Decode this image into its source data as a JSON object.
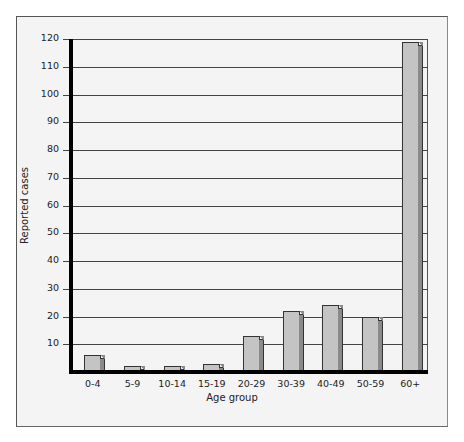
{
  "chart_data": {
    "type": "bar",
    "title": "",
    "xlabel": "Age group",
    "ylabel": "Reported cases",
    "categories": [
      "0-4",
      "5-9",
      "10-14",
      "15-19",
      "20-29",
      "30-39",
      "40-49",
      "50-59",
      "60+"
    ],
    "values": [
      6,
      2,
      2,
      3,
      13,
      22,
      24,
      20,
      119
    ],
    "ylim": [
      0,
      120
    ],
    "yticks": [
      10,
      20,
      30,
      40,
      50,
      60,
      70,
      80,
      90,
      100,
      110,
      120
    ],
    "grid": true,
    "legend": null,
    "bar_style": "3d",
    "colors": {
      "bar_front": "#c4c4c4",
      "bar_side": "#8a8a8a",
      "background": "#f4f4f4",
      "axis": "#000000"
    }
  }
}
